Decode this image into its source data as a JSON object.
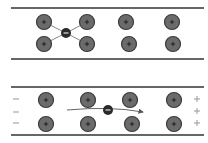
{
  "panels": [
    {
      "name": "panel-top",
      "top_line_y": 8,
      "bottom_line_y": 59,
      "ions": [
        {
          "x": 44,
          "y": 22
        },
        {
          "x": 87,
          "y": 22
        },
        {
          "x": 126,
          "y": 22
        },
        {
          "x": 172,
          "y": 22
        },
        {
          "x": 44,
          "y": 44
        },
        {
          "x": 87,
          "y": 44
        },
        {
          "x": 129,
          "y": 44
        },
        {
          "x": 173,
          "y": 44
        }
      ],
      "electron": {
        "x": 66,
        "y": 33
      },
      "ion_symbol": "+",
      "electron_symbol": "−"
    },
    {
      "name": "panel-bottom",
      "top_line_y": 87,
      "bottom_line_y": 135,
      "ions": [
        {
          "x": 46,
          "y": 100
        },
        {
          "x": 88,
          "y": 100
        },
        {
          "x": 130,
          "y": 100
        },
        {
          "x": 174,
          "y": 100
        },
        {
          "x": 46,
          "y": 124
        },
        {
          "x": 88,
          "y": 124
        },
        {
          "x": 132,
          "y": 124
        },
        {
          "x": 174,
          "y": 124
        }
      ],
      "electron": {
        "x": 108,
        "y": 110
      },
      "left_charges": [
        "−",
        "−",
        "−"
      ],
      "right_charges": [
        "+",
        "+",
        "+"
      ],
      "ion_symbol": "+",
      "electron_symbol": "−"
    }
  ],
  "colors": {
    "line": "#333333",
    "ion_fill": "#6b6b6b",
    "ion_stroke": "#3a3a3a",
    "electron_fill": "#2a2a2a",
    "bond": "#888888",
    "charge_text": "#999999"
  }
}
